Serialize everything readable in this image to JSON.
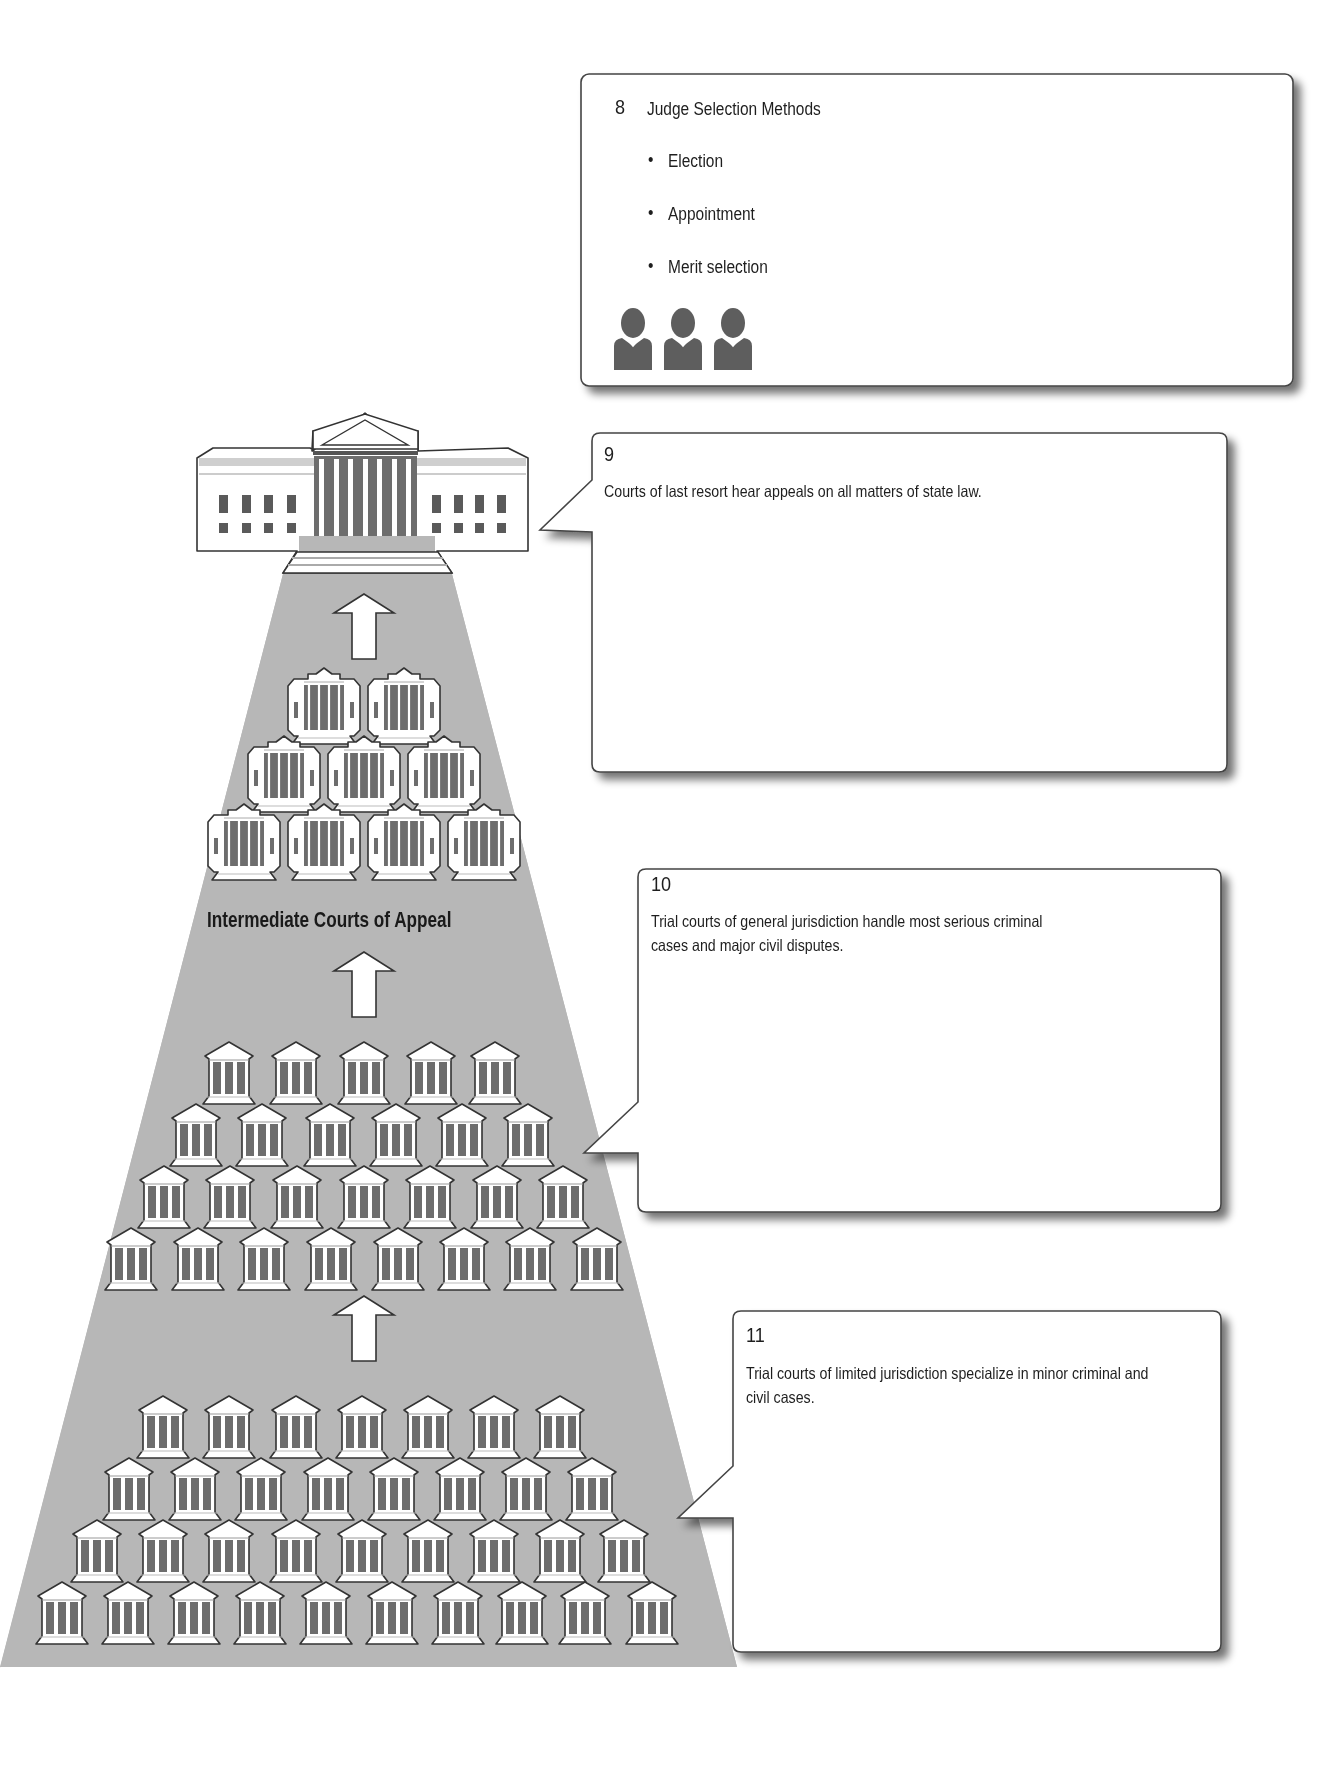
{
  "diagram": {
    "type": "state-court-pyramid",
    "colors": {
      "pyramid_fill": "#b7b7b7",
      "building_dark": "#6d6d6d",
      "outline": "#333333",
      "box_border": "#444444",
      "box_shadow": "#8a8a8a",
      "person_fill": "#5e5e5e"
    },
    "tiers": [
      {
        "name": "Courts of last resort",
        "buildings": 1
      },
      {
        "name": "Intermediate Courts of Appeal",
        "label": "Intermediate Courts of Appeal",
        "buildings": 9,
        "rows": [
          2,
          3,
          4
        ]
      },
      {
        "name": "Trial courts of general jurisdiction",
        "buildings": 26,
        "rows": [
          5,
          6,
          7,
          8
        ]
      },
      {
        "name": "Trial courts of limited jurisdiction",
        "buildings": 34,
        "rows": [
          7,
          8,
          9,
          10
        ]
      }
    ]
  },
  "boxes": {
    "box8": {
      "number": "8",
      "title": "Judge Selection Methods",
      "items": [
        "Election",
        "Appointment",
        "Merit selection"
      ],
      "icon": "three-judges-icon"
    },
    "box9": {
      "number": "9",
      "text": "Courts of last resort hear appeals on all matters of state law."
    },
    "box10": {
      "number": "10",
      "text": "Trial courts of general jurisdiction handle most serious criminal cases and major civil disputes."
    },
    "box11": {
      "number": "11",
      "text": "Trial courts of limited jurisdiction specialize in minor criminal and civil cases."
    }
  }
}
